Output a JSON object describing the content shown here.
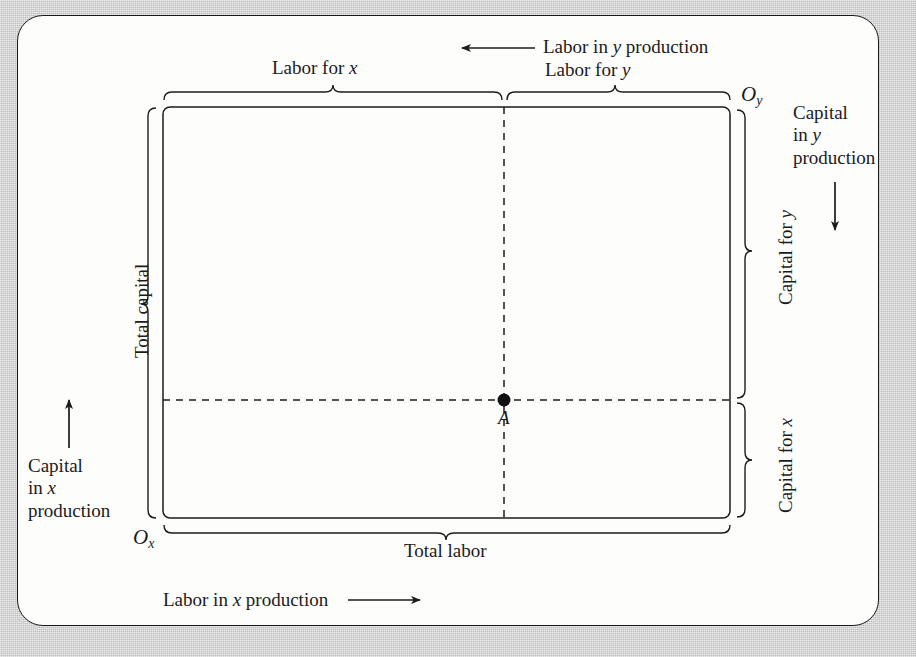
{
  "figure": {
    "kind": "edgeworth-box",
    "background_color": "#cfcfcf",
    "panel_color": "#fdfdfb",
    "ink_color": "#1b1b1b"
  },
  "labels": {
    "labor_for_x": "Labor for x",
    "labor_for_y": "Labor for y",
    "labor_in_y_production": "Labor in y production",
    "labor_in_x_production": "Labor in x production",
    "total_labor": "Total labor",
    "total_capital": "Total capital",
    "capital_for_x": "Capital for x",
    "capital_for_y": "Capital for y",
    "capital_in_x_production": [
      "Capital",
      "in x",
      "production"
    ],
    "capital_in_y_production": [
      "Capital",
      "in y",
      "production"
    ],
    "origin_x": "O",
    "origin_x_sub": "x",
    "origin_y": "O",
    "origin_y_sub": "y",
    "point_a": "A"
  },
  "arrows": {
    "labor_y_direction": "arrow-left",
    "labor_x_direction": "arrow-right",
    "capital_x_direction": "arrow-up",
    "capital_y_direction": "arrow-down"
  },
  "chart_data": {
    "type": "scatter",
    "title": "",
    "xlabel": "Total labor",
    "ylabel": "Total capital",
    "box": {
      "left": 0.0,
      "right": 1.0,
      "bottom": 0.0,
      "top": 1.0
    },
    "origins": [
      {
        "name": "Ox",
        "x": 0.0,
        "y": 0.0,
        "measures": [
          "Labor for x",
          "Capital for x"
        ]
      },
      {
        "name": "Oy",
        "x": 1.0,
        "y": 1.0,
        "measures": [
          "Labor for y",
          "Capital for y"
        ]
      }
    ],
    "points": [
      {
        "label": "A",
        "x": 0.6,
        "y": 0.28,
        "labor_for_x": 0.6,
        "labor_for_y": 0.4,
        "capital_for_x": 0.28,
        "capital_for_y": 0.72
      }
    ],
    "guide_lines": [
      {
        "orientation": "vertical",
        "at": 0.6,
        "style": "dashed"
      },
      {
        "orientation": "horizontal",
        "at": 0.28,
        "style": "dashed"
      }
    ],
    "braces": [
      {
        "label": "Labor for x",
        "side": "top",
        "from": 0.0,
        "to": 0.6
      },
      {
        "label": "Labor for y",
        "side": "top",
        "from": 0.6,
        "to": 1.0
      },
      {
        "label": "Total labor",
        "side": "bottom",
        "from": 0.0,
        "to": 1.0
      },
      {
        "label": "Total capital",
        "side": "left",
        "from": 0.0,
        "to": 1.0
      },
      {
        "label": "Capital for y",
        "side": "right",
        "from": 0.28,
        "to": 1.0
      },
      {
        "label": "Capital for x",
        "side": "right",
        "from": 0.0,
        "to": 0.28
      }
    ],
    "grid": false,
    "legend": "none"
  }
}
